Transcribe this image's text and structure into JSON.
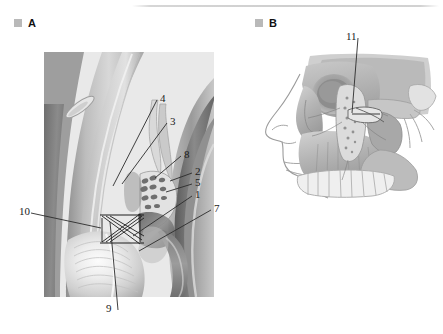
{
  "figure": {
    "background_color": "#ffffff",
    "rule_color": "#d0d0d0",
    "label_color": "#1b1b1b",
    "bullet_color": "#b9b9b9",
    "leader_color": "#2b2b2b"
  },
  "panels": [
    {
      "id": "A",
      "bullet": "square-bullet",
      "letter": "A",
      "caption": "A",
      "subject": "anterior-eye-segment-cross-section"
    },
    {
      "id": "B",
      "bullet": "square-bullet",
      "letter": "B",
      "caption": "B",
      "subject": "lateral-facial-skeleton-profile"
    }
  ],
  "panel_a": {
    "letter": "A",
    "leaders": [
      {
        "number": "4",
        "label_x": 160,
        "label_y": 93,
        "tip_x": 113,
        "tip_y": 186
      },
      {
        "number": "3",
        "label_x": 170,
        "label_y": 116,
        "tip_x": 122,
        "tip_y": 184
      },
      {
        "number": "8",
        "label_x": 184,
        "label_y": 149,
        "tip_x": 155,
        "tip_y": 178
      },
      {
        "number": "2",
        "label_x": 195,
        "label_y": 166,
        "tip_x": 170,
        "tip_y": 181
      },
      {
        "number": "5",
        "label_x": 195,
        "label_y": 177,
        "tip_x": 166,
        "tip_y": 192
      },
      {
        "number": "1",
        "label_x": 195,
        "label_y": 189,
        "tip_x": 133,
        "tip_y": 236
      },
      {
        "number": "7",
        "label_x": 214,
        "label_y": 203,
        "tip_x": 139,
        "tip_y": 251
      },
      {
        "number": "10",
        "label_x": 19,
        "label_y": 206,
        "tip_x": 101,
        "tip_y": 228
      },
      {
        "number": "9",
        "label_x": 106,
        "label_y": 303,
        "tip_x": 110,
        "tip_y": 222
      }
    ]
  },
  "panel_b": {
    "letter": "B",
    "leaders": [
      {
        "number": "11",
        "label_x": 346,
        "label_y": 31,
        "tip_x": 352,
        "tip_y": 113
      }
    ]
  },
  "numbers_legend": {
    "items": [
      "1",
      "2",
      "3",
      "4",
      "5",
      "7",
      "8",
      "9",
      "10",
      "11"
    ]
  }
}
